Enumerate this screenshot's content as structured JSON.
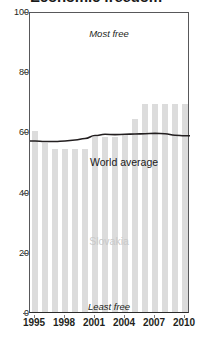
{
  "chart": {
    "title": "Economic freedom",
    "annotation_top": "Most free",
    "annotation_bottom": "Least free",
    "series_watermark": "Slovakia",
    "line_label": "World average",
    "bar_color": "#dcdcdc",
    "line_color": "#231f20",
    "watermark_color": "#c9c9c9"
  },
  "chart_data": {
    "type": "bar",
    "title": "Economic freedom",
    "xlabel": "",
    "ylabel": "",
    "ylim": [
      0,
      100
    ],
    "xlim": [
      1995,
      2010
    ],
    "grid": false,
    "legend": "none",
    "yticks": [
      0,
      20,
      40,
      60,
      80,
      100
    ],
    "xticks": [
      1995,
      1998,
      2001,
      2004,
      2007,
      2010
    ],
    "x": [
      1995,
      1996,
      1997,
      1998,
      1999,
      2000,
      2001,
      2002,
      2003,
      2004,
      2005,
      2006,
      2007,
      2008,
      2009,
      2010
    ],
    "categories": [
      "1995",
      "1996",
      "1997",
      "1998",
      "1999",
      "2000",
      "2001",
      "2002",
      "2003",
      "2004",
      "2005",
      "2006",
      "2007",
      "2008",
      "2009",
      "2010"
    ],
    "series": [
      {
        "name": "Slovakia",
        "type": "bar",
        "values": [
          60,
          56,
          54,
          54,
          54,
          54,
          58,
          58,
          58,
          59,
          64,
          69,
          69,
          69,
          69,
          69
        ]
      },
      {
        "name": "World average",
        "type": "line",
        "values": [
          57.5,
          57.3,
          57.3,
          57.5,
          57.8,
          58.3,
          59.3,
          59.7,
          59.6,
          59.7,
          59.8,
          59.9,
          60.0,
          59.9,
          59.4,
          59.2
        ]
      }
    ],
    "annotations": [
      {
        "text": "Most free",
        "position": "top-center"
      },
      {
        "text": "Least free",
        "position": "bottom-center"
      },
      {
        "text": "Slovakia",
        "position": "center"
      },
      {
        "text": "World average",
        "position": "on-line"
      }
    ]
  }
}
